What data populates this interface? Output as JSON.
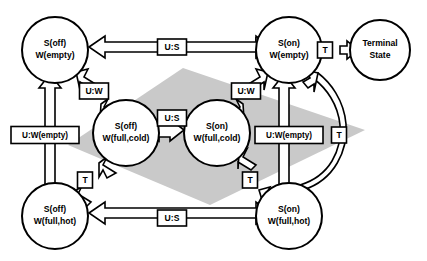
{
  "diagram": {
    "background_color": "#ffffff",
    "band_color": "#c9c9c9",
    "stroke_color": "#000000",
    "nodes": [
      {
        "id": "off_empty",
        "line1": "S(off)",
        "line2": "W(empty)",
        "cx": 55,
        "cy": 50,
        "r": 33
      },
      {
        "id": "on_empty",
        "line1": "S(on)",
        "line2": "W(empty)",
        "cx": 289,
        "cy": 50,
        "r": 33
      },
      {
        "id": "terminal",
        "line1": "Terminal",
        "line2": "State",
        "cx": 380,
        "cy": 50,
        "r": 30
      },
      {
        "id": "off_full_cold",
        "line1": "S(off)",
        "line2": "W(full,cold)",
        "cx": 126,
        "cy": 133,
        "r": 33
      },
      {
        "id": "on_full_cold",
        "line1": "S(on)",
        "line2": "W(full,cold)",
        "cx": 217,
        "cy": 133,
        "r": 33
      },
      {
        "id": "off_full_hot",
        "line1": "S(off)",
        "line2": "W(full,hot)",
        "cx": 55,
        "cy": 216,
        "r": 33
      },
      {
        "id": "on_full_hot",
        "line1": "S(on)",
        "line2": "W(full,hot)",
        "cx": 289,
        "cy": 216,
        "r": 33
      }
    ],
    "edge_labels": [
      {
        "id": "us_top",
        "text": "U:S",
        "x": 172,
        "y": 47,
        "w": 29,
        "h": 16
      },
      {
        "id": "t_terminal",
        "text": "T",
        "x": 325,
        "y": 50,
        "w": 15,
        "h": 16
      },
      {
        "id": "uw_left",
        "text": "U:W",
        "x": 94,
        "y": 91,
        "w": 29,
        "h": 16
      },
      {
        "id": "uw_right",
        "text": "U:W",
        "x": 246,
        "y": 91,
        "w": 29,
        "h": 16
      },
      {
        "id": "us_middle",
        "text": "U:S",
        "x": 172,
        "y": 118,
        "w": 29,
        "h": 16
      },
      {
        "id": "uwempty_left",
        "text": "U:W(empty)",
        "x": 45,
        "y": 135,
        "w": 68,
        "h": 17
      },
      {
        "id": "uwempty_right",
        "text": "U:W(empty)",
        "x": 289,
        "y": 135,
        "w": 68,
        "h": 17
      },
      {
        "id": "t_right_curve",
        "text": "T",
        "x": 339,
        "y": 135,
        "w": 15,
        "h": 16
      },
      {
        "id": "t_left_diag",
        "text": "T",
        "x": 85,
        "y": 180,
        "w": 15,
        "h": 16
      },
      {
        "id": "t_right_diag",
        "text": "T",
        "x": 250,
        "y": 180,
        "w": 15,
        "h": 16
      },
      {
        "id": "us_bottom",
        "text": "U:S",
        "x": 172,
        "y": 218,
        "w": 29,
        "h": 16
      }
    ],
    "transitions": [
      {
        "id": "on_empty-to-off_empty",
        "label": "U:S",
        "from": "on_empty",
        "to": "off_empty",
        "style": "straight-horizontal"
      },
      {
        "id": "on_empty-to-terminal",
        "label": "T",
        "from": "on_empty",
        "to": "terminal",
        "style": "straight-horizontal"
      },
      {
        "id": "off_empty-to-off_full_cold",
        "label": "U:W",
        "from": "off_empty",
        "to": "off_full_cold",
        "style": "diagonal"
      },
      {
        "id": "on_empty-to-on_full_cold",
        "label": "U:W",
        "from": "on_empty",
        "to": "on_full_cold",
        "style": "diagonal"
      },
      {
        "id": "off_full_cold-to-on_full_cold",
        "label": "U:S",
        "from": "off_full_cold",
        "to": "on_full_cold",
        "style": "bidirectional-horizontal"
      },
      {
        "id": "off_full_hot-to-off_empty",
        "label": "U:W(empty)",
        "from": "off_full_hot",
        "to": "off_empty",
        "style": "straight-vertical"
      },
      {
        "id": "on_full_hot-to-on_empty",
        "label": "U:W(empty)",
        "from": "on_full_hot",
        "to": "on_empty",
        "style": "straight-vertical"
      },
      {
        "id": "on_full_hot-to-on_empty-curve",
        "label": "T",
        "from": "on_full_hot",
        "to": "on_empty",
        "style": "curved"
      },
      {
        "id": "off_full_hot-to-off_full_cold",
        "label": "T",
        "from": "off_full_hot",
        "to": "off_full_cold",
        "style": "diagonal"
      },
      {
        "id": "on_full_cold-to-on_full_hot",
        "label": "T",
        "from": "on_full_cold",
        "to": "on_full_hot",
        "style": "diagonal"
      },
      {
        "id": "on_full_hot-to-off_full_hot",
        "label": "U:S",
        "from": "on_full_hot",
        "to": "off_full_hot",
        "style": "straight-horizontal"
      }
    ]
  }
}
